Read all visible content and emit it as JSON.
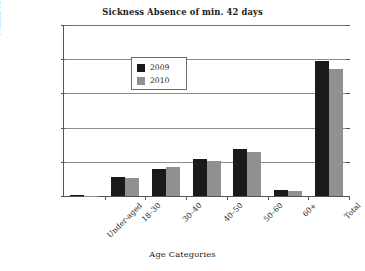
{
  "chart_data": {
    "type": "bar",
    "title": "Sickness Absence of min. 42 days",
    "xlabel": "Age Categories",
    "ylabel": "Number of Cases",
    "categories": [
      "Under-aged",
      "18–30",
      "30–40",
      "40–50",
      "50–60",
      "60+",
      "Total"
    ],
    "series": [
      {
        "name": "2009",
        "color": "#1a1a1a",
        "values": [
          10,
          280,
          400,
          545,
          690,
          90,
          1980
        ]
      },
      {
        "name": "2010",
        "color": "#909090",
        "values": [
          3,
          258,
          425,
          510,
          640,
          70,
          1860
        ]
      }
    ],
    "ylim": [
      0,
      2500
    ],
    "yticks": [
      0,
      500,
      1000,
      1500,
      2000,
      2500
    ],
    "ytick_labels": [
      "0",
      "500",
      "1000",
      "1500",
      "2000",
      "2500"
    ],
    "grid": true,
    "legend_position": "upper-left"
  }
}
